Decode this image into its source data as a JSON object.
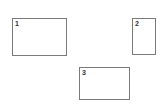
{
  "boxes": [
    {
      "label": "1"
    },
    {
      "label": "2"
    },
    {
      "label": "3"
    }
  ]
}
